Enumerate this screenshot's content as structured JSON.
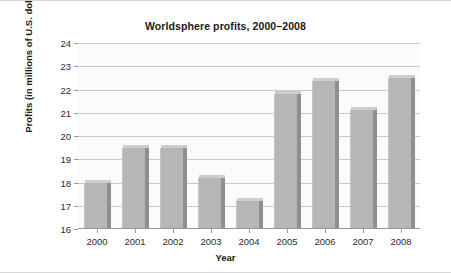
{
  "chart_data": {
    "type": "bar",
    "title": "Worldsphere profits, 2000–2008",
    "xlabel": "Year",
    "ylabel": "Profits (in millions of U.S. dollars)",
    "categories": [
      "2000",
      "2001",
      "2002",
      "2003",
      "2004",
      "2005",
      "2006",
      "2007",
      "2008"
    ],
    "values": [
      18.0,
      19.5,
      19.5,
      18.2,
      17.2,
      21.8,
      22.35,
      21.1,
      22.5
    ],
    "ylim": [
      16,
      24
    ],
    "ytick_labels": [
      "24",
      "23",
      "22",
      "21",
      "20",
      "19",
      "18",
      "17",
      "16"
    ],
    "yticks": [
      24,
      23,
      22,
      21,
      20,
      19,
      18,
      17,
      16
    ],
    "ystep": 1,
    "grid": true,
    "legend": false,
    "series": [
      {
        "name": "Profits",
        "values": [
          18.0,
          19.5,
          19.5,
          18.2,
          17.2,
          21.8,
          22.35,
          21.1,
          22.5
        ]
      }
    ],
    "colors": {
      "bar_face": "#b6b6b6",
      "bar_side": "#8f8f8f",
      "bar_top": "#cdcdcd",
      "plot_background": "#fbfbfb",
      "gridline": "#c9c9c9",
      "axis": "#9a9a9a",
      "text": "#1a1a1a"
    }
  }
}
